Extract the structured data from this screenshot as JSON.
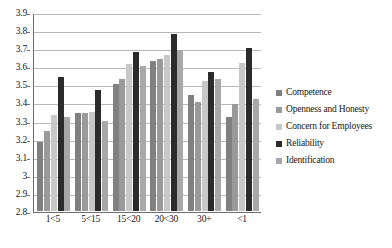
{
  "chart_data": {
    "type": "bar",
    "title": "",
    "subtitle": "",
    "xlabel": "",
    "ylabel": "",
    "ylim": [
      2.8,
      3.9
    ],
    "ytick_step": 0.1,
    "yticks": [
      "3.9",
      "3.8",
      "3.7",
      "3.6",
      "3.5",
      "3.4",
      "3.3",
      "3.2",
      "3.1",
      "3",
      "2.9",
      "2.8"
    ],
    "grid": true,
    "grid_axis": "y",
    "legend_position": "right",
    "categories": [
      "1<5",
      "5<15",
      "15<20",
      "20<30",
      "30+",
      "<1"
    ],
    "series": [
      {
        "name": "Competence",
        "color": "#808080",
        "values": [
          3.18,
          3.34,
          3.5,
          3.63,
          3.44,
          3.32
        ]
      },
      {
        "name": "Openness and Honesty",
        "color": "#9a9a9a",
        "values": [
          3.24,
          3.34,
          3.53,
          3.64,
          3.4,
          3.39
        ]
      },
      {
        "name": "Concern for Employees",
        "color": "#c8c8c8",
        "values": [
          3.33,
          3.35,
          3.61,
          3.66,
          3.52,
          3.62
        ]
      },
      {
        "name": "Reliability",
        "color": "#2b2b2b",
        "values": [
          3.54,
          3.47,
          3.68,
          3.78,
          3.57,
          3.7
        ]
      },
      {
        "name": "Identification",
        "color": "#a8a8a8",
        "values": [
          3.32,
          3.3,
          3.6,
          3.69,
          3.53,
          3.42
        ]
      }
    ]
  }
}
